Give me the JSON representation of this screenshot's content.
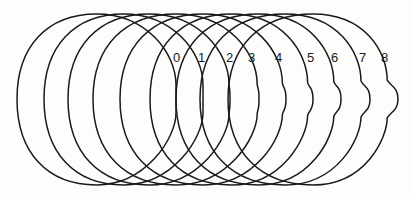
{
  "figure": {
    "width": 413,
    "height": 198,
    "stroke_color": "#1a1a1a",
    "background": "#fdfdfb",
    "top_y": 14,
    "bottom_y": 185,
    "mid_y": 99,
    "contours": [
      {
        "label": "0",
        "left_x": 17,
        "right_x": 176,
        "bulge": 0,
        "label_x": 173,
        "label_y": 62
      },
      {
        "label": "1",
        "left_x": 44,
        "right_x": 203,
        "bulge": 0,
        "label_x": 198,
        "label_y": 62
      },
      {
        "label": "2",
        "left_x": 68,
        "right_x": 230,
        "bulge": 1,
        "label_x": 226,
        "label_y": 62
      },
      {
        "label": "3",
        "left_x": 93,
        "right_x": 259,
        "bulge": 2,
        "label_x": 248,
        "label_y": 62
      },
      {
        "label": "4",
        "left_x": 120,
        "right_x": 286,
        "bulge": 4,
        "label_x": 275,
        "label_y": 62
      },
      {
        "label": "5",
        "left_x": 150,
        "right_x": 313,
        "bulge": 6,
        "label_x": 307,
        "label_y": 62
      },
      {
        "label": "6",
        "left_x": 176,
        "right_x": 341,
        "bulge": 8,
        "label_x": 331,
        "label_y": 62
      },
      {
        "label": "7",
        "left_x": 200,
        "right_x": 370,
        "bulge": 10,
        "label_x": 359,
        "label_y": 62
      },
      {
        "label": "8",
        "left_x": 228,
        "right_x": 398,
        "bulge": 12,
        "label_x": 381,
        "label_y": 62
      }
    ]
  }
}
